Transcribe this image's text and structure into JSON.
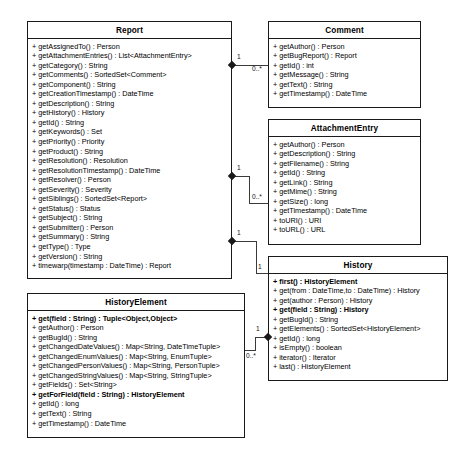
{
  "diagram": {
    "type": "uml-class-diagram",
    "background": "#ffffff",
    "line_color": "#3a3a3a",
    "border_color": "#1a1a1a"
  },
  "classes": [
    {
      "name": "Report",
      "members": [
        "+ getAssignedTo() : Person",
        "+ getAttachmentEntries() : List<AttachmentEntry>",
        "+ getCategory() : String",
        "+ getComments() : SortedSet<Comment>",
        "+ getComponent() : String",
        "+ getCreationTimestamp() : DateTime",
        "+ getDescription() : String",
        "+ getHistory() : History",
        "+ getId() : String",
        "+ getKeywords() : Set",
        "+ getPriority() : Priority",
        "+ getProduct() : String",
        "+ getResolution() : Resolution",
        "+ getResolutionTimestamp() : DateTime",
        "+ getResolver() : Person",
        "+ getSeverity() : Severity",
        "+ getSiblings() : SortedSet<Report>",
        "+ getStatus() : Status",
        "+ getSubject() : String",
        "+ getSubmitter() : Person",
        "+ getSummary() : String",
        "+ getType() : Type",
        "+ getVersion() : String",
        "+ timewarp(timestamp : DateTime) : Report"
      ]
    },
    {
      "name": "Comment",
      "members": [
        "+ getAuthor() : Person",
        "+ getBugReport() : Report",
        "+ getId() : int",
        "+ getMessage() : String",
        "+ getText() : String",
        "+ getTimestamp() : DateTime"
      ]
    },
    {
      "name": "AttachmentEntry",
      "members": [
        "+ getAuthor() : Person",
        "+ getDescription() : String",
        "+ getFilename() : String",
        "+ getId() : String",
        "+ getLink() : String",
        "+ getMime() : String",
        "+ getSize() : long",
        "+ getTimestamp() : DateTime",
        "+ toURI() : URI",
        "+ toURL() : URL"
      ]
    },
    {
      "name": "History",
      "members": [
        "+ first() : HistoryElement",
        "+ get(from : DateTime,to : DateTime) : History",
        "+ get(author : Person) : History",
        "+ get(field : String) : History",
        "+ getBugId() : String",
        "+ getElements() : SortedSet<HistoryElement>",
        "+ getId() : long",
        "+ isEmpty() : boolean",
        "+ iterator() : Iterator",
        "+ last() : HistoryElement"
      ]
    },
    {
      "name": "HistoryElement",
      "members": [
        "+ get(field : String) : Tuple<Object,Object>",
        "+ getAuthor() : Person",
        "+ getBugId() : String",
        "+ getChangedDateValues() : Map<String, DateTimeTuple>",
        "+ getChangedEnumValues() : Map<String, EnumTuple>",
        "+ getChangedPersonValues() : Map<String, PersonTuple>",
        "+ getChangedStringValues() : Map<String, StringTuple>",
        "+ getFields() : Set<String>",
        "+ getForField(field : String) : HistoryElement",
        "+ getId() : long",
        "+ getText() : String",
        "+ getTimestamp() : DateTime"
      ]
    }
  ],
  "bold_members": {
    "history": [
      "+ first() : HistoryElement",
      "+ get(field : String) : History"
    ],
    "history_element": [
      "+ get(field : String) : Tuple<Object,Object>",
      "+ getForField(field : String) : HistoryElement"
    ]
  },
  "associations": [
    {
      "source": "Report",
      "target": "Comment",
      "source_mult": "1",
      "target_mult": "0..*",
      "kind": "composition"
    },
    {
      "source": "Report",
      "target": "AttachmentEntry",
      "source_mult": "1",
      "target_mult": "0..*",
      "kind": "composition"
    },
    {
      "source": "Report",
      "target": "History",
      "source_mult": "1",
      "target_mult": "1",
      "kind": "composition"
    },
    {
      "source": "History",
      "target": "HistoryElement",
      "source_mult": "1",
      "target_mult": "0..*",
      "kind": "composition"
    }
  ]
}
